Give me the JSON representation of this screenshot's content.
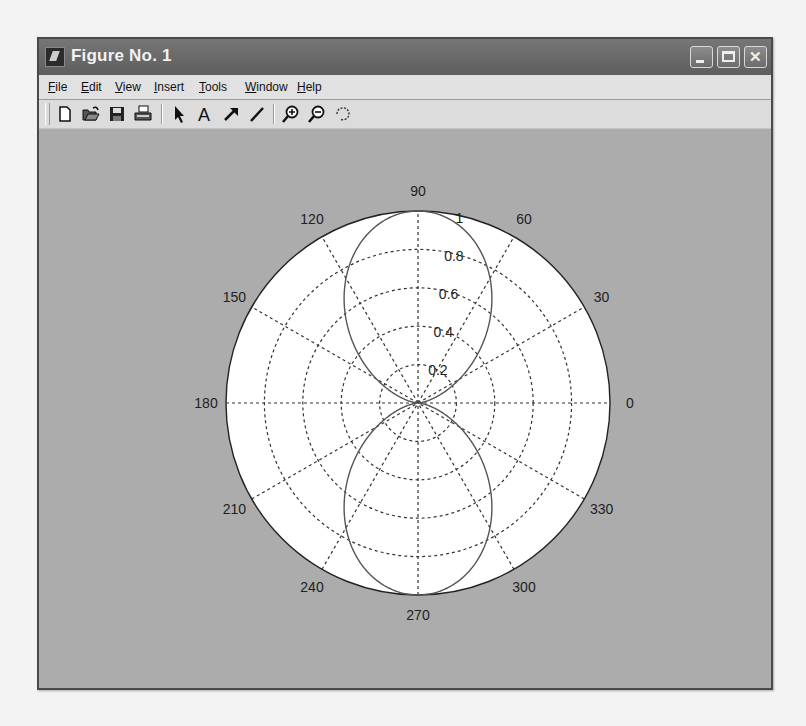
{
  "window": {
    "title": "Figure No. 1",
    "controls": {
      "minimize": "minimize",
      "maximize": "maximize",
      "close": "close"
    }
  },
  "menu": {
    "items": [
      {
        "label": "File",
        "accel": "F"
      },
      {
        "label": "Edit",
        "accel": "E"
      },
      {
        "label": "View",
        "accel": "V"
      },
      {
        "label": "Insert",
        "accel": "I"
      },
      {
        "label": "Tools",
        "accel": "T"
      },
      {
        "label": "Window",
        "accel": "W"
      },
      {
        "label": "Help",
        "accel": "H"
      }
    ]
  },
  "toolbar": {
    "icons": [
      "new-figure-icon",
      "open-file-icon",
      "save-icon",
      "print-icon",
      "edit-plot-arrow-icon",
      "insert-text-icon",
      "insert-arrow-icon",
      "insert-line-icon",
      "zoom-in-icon",
      "zoom-out-icon",
      "rotate-3d-icon"
    ]
  },
  "colors": {
    "figure_bg": "#acacac",
    "axes_bg": "#ffffff",
    "grid": "#333333",
    "curve": "#555555",
    "titlebar": "#666666"
  },
  "chart_data": {
    "type": "polar",
    "title": "",
    "function": "r = sin(theta)^2",
    "angular_ticks": [
      "0",
      "30",
      "60",
      "90",
      "120",
      "150",
      "180",
      "210",
      "240",
      "270",
      "300",
      "330"
    ],
    "angular_tick_values": [
      0,
      30,
      60,
      90,
      120,
      150,
      180,
      210,
      240,
      270,
      300,
      330
    ],
    "radial_ticks": [
      "0.2",
      "0.4",
      "0.6",
      "0.8",
      "1"
    ],
    "radial_tick_values": [
      0.2,
      0.4,
      0.6,
      0.8,
      1.0
    ],
    "rlim": [
      0,
      1
    ],
    "grid": true,
    "grid_style": "dotted",
    "series": [
      {
        "name": "r = sin^2(theta)",
        "theta_deg": [
          0,
          15,
          30,
          45,
          60,
          75,
          90,
          105,
          120,
          135,
          150,
          165,
          180,
          195,
          210,
          225,
          240,
          255,
          270,
          285,
          300,
          315,
          330,
          345,
          360
        ],
        "r": [
          0,
          0.067,
          0.25,
          0.5,
          0.75,
          0.933,
          1,
          0.933,
          0.75,
          0.5,
          0.25,
          0.067,
          0,
          0.067,
          0.25,
          0.5,
          0.75,
          0.933,
          1,
          0.933,
          0.75,
          0.5,
          0.25,
          0.067,
          0
        ]
      }
    ],
    "legend": null
  }
}
